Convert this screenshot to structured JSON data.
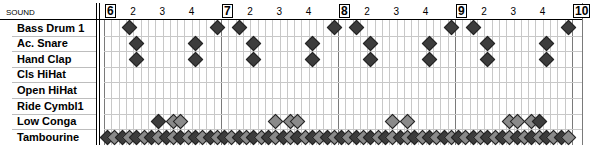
{
  "header": {
    "sound_label": "SOUND"
  },
  "bars": [
    {
      "label": "6",
      "x": 104
    },
    {
      "label": "7",
      "x": 221
    },
    {
      "label": "8",
      "x": 338
    },
    {
      "label": "9",
      "x": 455
    },
    {
      "label": "10",
      "x": 572
    }
  ],
  "beat_labels": [
    "2",
    "3",
    "4"
  ],
  "grid": {
    "left": 104,
    "bar_width": 117,
    "steps_per_bar": 16,
    "rows": 8,
    "row_height": 15.6,
    "num_bars": 4
  },
  "sounds": [
    {
      "name": "Bass Drum 1"
    },
    {
      "name": "Ac. Snare"
    },
    {
      "name": "Hand Clap"
    },
    {
      "name": "Cls HiHat"
    },
    {
      "name": "Open HiHat"
    },
    {
      "name": "Ride Cymbl1"
    },
    {
      "name": "Low Conga"
    },
    {
      "name": "Tambourine"
    }
  ],
  "notes": {
    "0": [
      [
        0,
        3,
        "dark"
      ],
      [
        0,
        15,
        "dark"
      ],
      [
        1,
        2,
        "dark"
      ],
      [
        1,
        15,
        "dark"
      ],
      [
        2,
        2,
        "dark"
      ],
      [
        2,
        15,
        "dark"
      ],
      [
        3,
        2,
        "dark"
      ],
      [
        3,
        15,
        "dark"
      ]
    ],
    "1": [
      [
        0,
        4,
        "dark"
      ],
      [
        0,
        12,
        "dark"
      ],
      [
        1,
        4,
        "dark"
      ],
      [
        1,
        12,
        "dark"
      ],
      [
        2,
        4,
        "dark"
      ],
      [
        2,
        12,
        "dark"
      ],
      [
        3,
        4,
        "dark"
      ],
      [
        3,
        12,
        "dark"
      ]
    ],
    "2": [
      [
        0,
        4,
        "dark"
      ],
      [
        0,
        12,
        "dark"
      ],
      [
        1,
        4,
        "dark"
      ],
      [
        1,
        12,
        "dark"
      ],
      [
        2,
        4,
        "dark"
      ],
      [
        2,
        12,
        "dark"
      ],
      [
        3,
        4,
        "dark"
      ],
      [
        3,
        12,
        "dark"
      ]
    ],
    "6": [
      [
        0,
        7,
        "dark"
      ],
      [
        0,
        9,
        "light"
      ],
      [
        0,
        10,
        "light"
      ],
      [
        1,
        7,
        "light"
      ],
      [
        1,
        9,
        "light"
      ],
      [
        1,
        10,
        "light"
      ],
      [
        2,
        7,
        "light"
      ],
      [
        2,
        9,
        "light"
      ],
      [
        3,
        7,
        "light"
      ],
      [
        3,
        8,
        "light"
      ],
      [
        3,
        10,
        "light"
      ],
      [
        3,
        11,
        "dark"
      ]
    ],
    "7": "all"
  }
}
